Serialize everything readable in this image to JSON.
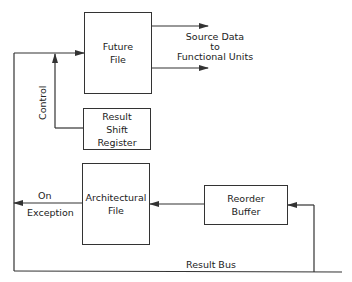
{
  "diagram": {
    "boxes": {
      "future_file": {
        "line1": "Future",
        "line2": "File"
      },
      "result_shift_register": {
        "line1": "Result",
        "line2": "Shift",
        "line3": "Register"
      },
      "architectural_file": {
        "line1": "Architectural",
        "line2": "File"
      },
      "reorder_buffer": {
        "line1": "Reorder",
        "line2": "Buffer"
      }
    },
    "labels": {
      "source_data_1": "Source Data",
      "source_data_2": "to",
      "source_data_3": "Functional Units",
      "control": "Control",
      "on_exception_1": "On",
      "on_exception_2": "Exception",
      "result_bus": "Result Bus"
    },
    "colors": {
      "line": "#333333",
      "background": "#ffffff"
    }
  }
}
